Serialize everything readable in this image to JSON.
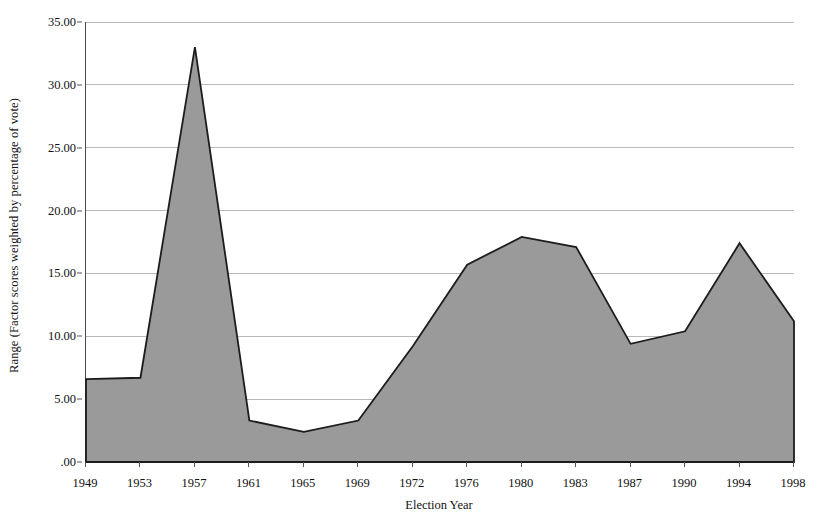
{
  "chart_data": {
    "type": "area",
    "title": "",
    "xlabel": "Election Year",
    "ylabel": "Range (Factor scores weighted by percentage of vote)",
    "categories": [
      "1949",
      "1953",
      "1957",
      "1961",
      "1965",
      "1969",
      "1972",
      "1976",
      "1980",
      "1983",
      "1987",
      "1990",
      "1994",
      "1998"
    ],
    "values": [
      6.6,
      6.7,
      33.0,
      3.3,
      2.4,
      3.3,
      9.2,
      15.7,
      17.9,
      17.1,
      9.4,
      10.4,
      17.4,
      11.2
    ],
    "series": [
      {
        "name": "Range",
        "values": [
          6.6,
          6.7,
          33.0,
          3.3,
          2.4,
          3.3,
          9.2,
          15.7,
          17.9,
          17.1,
          9.4,
          10.4,
          17.4,
          11.2
        ]
      }
    ],
    "ylim": [
      0,
      35
    ],
    "ytick_values": [
      35,
      30,
      25,
      20,
      15,
      10,
      5,
      0
    ],
    "ytick_labels": [
      "35.00",
      "30.00",
      "25.00",
      "20.00",
      "15.00",
      "10.00",
      "5.00",
      ".00"
    ],
    "xtick_labels": [
      "1949",
      "1953",
      "1957",
      "1961",
      "1965",
      "1969",
      "1972",
      "1976",
      "1980",
      "1983",
      "1987",
      "1990",
      "1994",
      "1998"
    ],
    "grid": "horizontal",
    "legend": "none",
    "colors": {
      "fill": "#9a9a9a",
      "line": "#1c1c1c",
      "grid": "#b9b9b9",
      "axis": "#4a4a4a",
      "background": "#ffffff",
      "text": "#111111"
    }
  },
  "axes": {
    "y_title": "Range (Factor scores weighted by percentage of vote)",
    "x_title": "Election Year"
  }
}
